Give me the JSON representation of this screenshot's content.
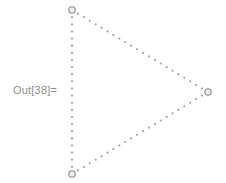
{
  "cell": {
    "background_color": "#ffffff",
    "label": "Out[38]=",
    "label_color": "#8e8e8e"
  },
  "graphic": {
    "name": "dotted-triangle",
    "dot_color": "#9a9a9a",
    "marker_stroke_color": "#8c8c8c",
    "marker_fill_color": "#ededed",
    "dot_size_px": 1.8,
    "dot_spacing_px": 7,
    "marker_radius_px": 3.2,
    "vertices": [
      {
        "name": "top-vertex",
        "x": 72,
        "y": 10
      },
      {
        "name": "right-vertex",
        "x": 208,
        "y": 92
      },
      {
        "name": "bottom-vertex",
        "x": 72,
        "y": 174
      }
    ],
    "edges": [
      {
        "name": "left-edge",
        "from": 0,
        "to": 2
      },
      {
        "name": "top-right-edge",
        "from": 0,
        "to": 1
      },
      {
        "name": "bottom-right-edge",
        "from": 2,
        "to": 1
      }
    ]
  }
}
